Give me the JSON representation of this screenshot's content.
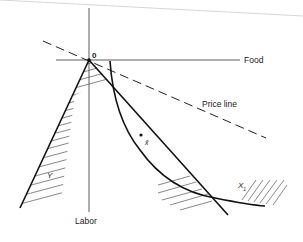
{
  "diagram": {
    "axes": {
      "horizontal_label": "Food",
      "vertical_label": "Labor",
      "origin_label": "0"
    },
    "curves": {
      "price_line_label": "Price line",
      "set_y_label": "Y",
      "set_x1_label": "X",
      "set_x1_subscript": "1",
      "point_label": "x̄"
    },
    "colors": {
      "ink": "#1a1a1a",
      "hatch": "#555555",
      "background": "#ffffff"
    }
  }
}
